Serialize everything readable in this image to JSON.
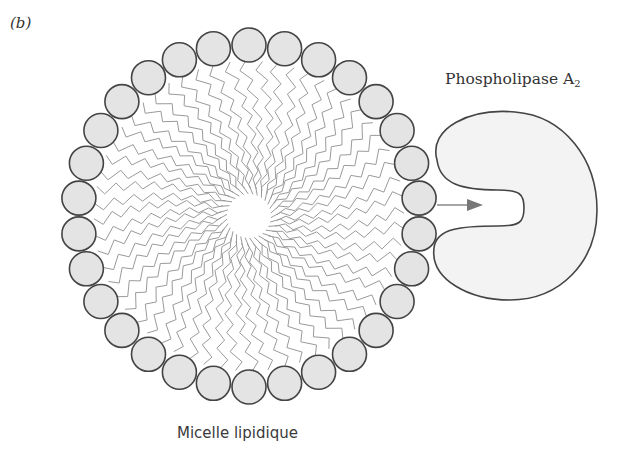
{
  "panel_label": "(b)",
  "labels": {
    "enzyme_name": "Phospholipase A",
    "enzyme_subscript": "2",
    "micelle_name": "Micelle lipidique"
  },
  "micelle": {
    "center": [
      249,
      216
    ],
    "head_ring_radius": 171,
    "head_radius": 17,
    "head_count": 30,
    "head_fill": "#e4e4e4",
    "head_stroke": "#444444",
    "tail_color": "#9a9a9a",
    "tail_inner_radius": 22,
    "tails_per_head": 2
  },
  "enzyme": {
    "fill": "#f3f3f3",
    "stroke": "#444444"
  },
  "arrow": {
    "from": [
      437,
      205
    ],
    "to": [
      483,
      205
    ],
    "color": "#777777"
  }
}
